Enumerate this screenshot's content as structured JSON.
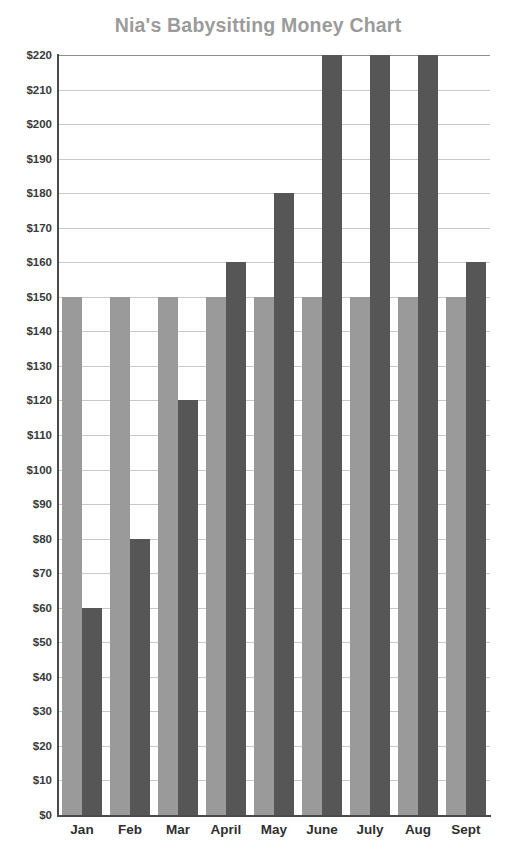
{
  "chart_data": {
    "type": "bar",
    "title": "Nia's Babysitting Money Chart",
    "xlabel": "",
    "ylabel": "",
    "categories": [
      "Jan",
      "Feb",
      "Mar",
      "April",
      "May",
      "June",
      "July",
      "Aug",
      "Sept"
    ],
    "series": [
      {
        "name": "Goal",
        "color": "#9a9a9a",
        "values": [
          150,
          150,
          150,
          150,
          150,
          150,
          150,
          150,
          150
        ]
      },
      {
        "name": "Earned",
        "color": "#565656",
        "values": [
          60,
          80,
          120,
          160,
          180,
          220,
          220,
          220,
          160
        ]
      }
    ],
    "ylim": [
      0,
      220
    ],
    "ytick_step": 10,
    "ytick_labels": [
      "$220",
      "$210",
      "$200",
      "$190",
      "$180",
      "$170",
      "$160",
      "$150",
      "$140",
      "$130",
      "$120",
      "$110",
      "$100",
      "$90",
      "$80",
      "$70",
      "$60",
      "$50",
      "$40",
      "$30",
      "$20",
      "$10",
      "$0"
    ],
    "ytick_values": [
      220,
      210,
      200,
      190,
      180,
      170,
      160,
      150,
      140,
      130,
      120,
      110,
      100,
      90,
      80,
      70,
      60,
      50,
      40,
      30,
      20,
      10,
      0
    ],
    "grid": true,
    "legend": "none",
    "currency_prefix": "$"
  },
  "colors": {
    "title": "#9b9b9b",
    "axis": "#4a4a4a",
    "gridline": "#c9c9c9",
    "tick_text": "#3a3a3a",
    "background": "#ffffff"
  }
}
